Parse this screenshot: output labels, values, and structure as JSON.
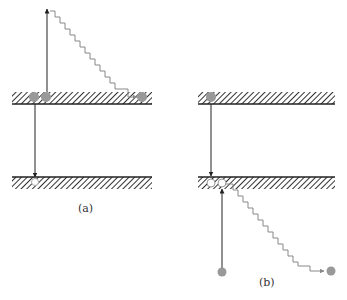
{
  "panels": [
    {
      "id": "a",
      "label": "(a)"
    },
    {
      "id": "b",
      "label": "(b)"
    }
  ],
  "colors": {
    "line": "#222222",
    "hatch": "#333333",
    "wavy": "#888888",
    "filled_circle": "#999999",
    "hole_circle": "#ffffff"
  }
}
